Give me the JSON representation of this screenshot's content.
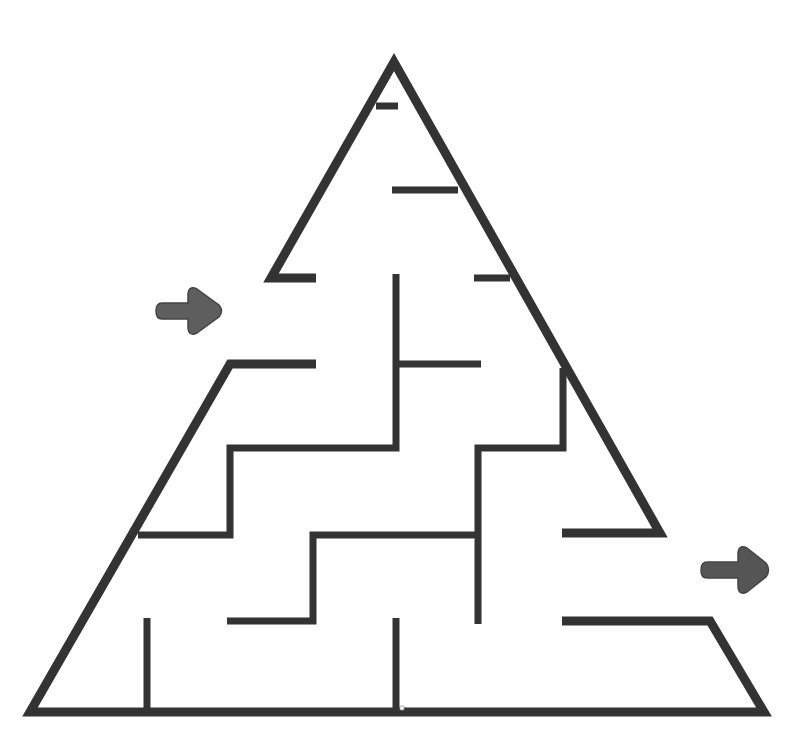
{
  "puzzle": {
    "type": "maze",
    "shape": "triangle",
    "title": "Triangle Maze",
    "colors": {
      "background": "#ffffff",
      "wall": "#333333",
      "arrow": "#5e5e5e",
      "arrow_outline": "#444444"
    },
    "entrance": {
      "label": "Start",
      "icon": "right-arrow-icon",
      "position": [
        190,
        311
      ]
    },
    "exit": {
      "label": "Finish",
      "icon": "right-arrow-icon",
      "position": [
        735,
        570
      ]
    },
    "outer_walls": [
      {
        "points": [
          [
            316,
            278
          ],
          [
            271,
            278
          ],
          [
            394,
            62
          ],
          [
            660,
            533
          ],
          [
            562,
            533
          ]
        ],
        "width": 9
      },
      {
        "points": [
          [
            316,
            364
          ],
          [
            230,
            364
          ],
          [
            30,
            712
          ],
          [
            764,
            712
          ],
          [
            710,
            621
          ],
          [
            562,
            621
          ]
        ],
        "width": 9
      }
    ],
    "inner_walls": [
      {
        "points": [
          [
            376,
            106
          ],
          [
            398,
            106
          ]
        ],
        "width": 7
      },
      {
        "points": [
          [
            392,
            190
          ],
          [
            458,
            190
          ]
        ],
        "width": 7
      },
      {
        "points": [
          [
            474,
            278
          ],
          [
            510,
            278
          ]
        ],
        "width": 7
      },
      {
        "points": [
          [
            396,
            274
          ],
          [
            396,
            448
          ],
          [
            230,
            448
          ],
          [
            230,
            535
          ],
          [
            138,
            535
          ]
        ],
        "width": 7
      },
      {
        "points": [
          [
            396,
            364
          ],
          [
            481,
            364
          ]
        ],
        "width": 7
      },
      {
        "points": [
          [
            563,
            368
          ],
          [
            563,
            448
          ],
          [
            478,
            448
          ],
          [
            478,
            624
          ]
        ],
        "width": 7
      },
      {
        "points": [
          [
            478,
            535
          ],
          [
            313,
            535
          ],
          [
            313,
            621
          ],
          [
            227,
            621
          ]
        ],
        "width": 7
      },
      {
        "points": [
          [
            147,
            618
          ],
          [
            147,
            708
          ]
        ],
        "width": 7
      },
      {
        "points": [
          [
            396,
            618
          ],
          [
            396,
            708
          ]
        ],
        "width": 7
      }
    ]
  }
}
